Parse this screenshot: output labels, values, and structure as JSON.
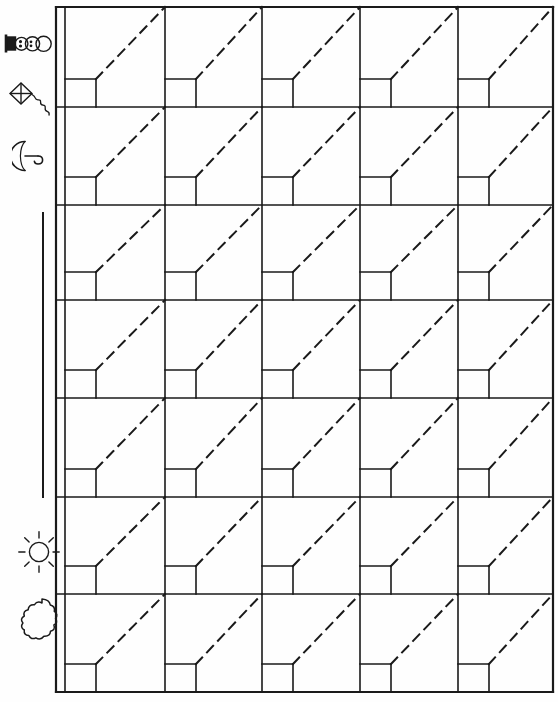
{
  "page": {
    "width": 558,
    "height": 702,
    "background_color": "#fefefe",
    "ink_color": "#1a1a1a"
  },
  "grid": {
    "rows": 7,
    "columns": 5,
    "left_border_x": 56,
    "label_column_right_x": 65,
    "right_border_x": 553,
    "column_boundaries": [
      65,
      165,
      262,
      360,
      458,
      553
    ],
    "row_boundaries": [
      7,
      107,
      205,
      300,
      398,
      497,
      594,
      692
    ],
    "cell_box": {
      "width": 31,
      "height": 28,
      "position": "bottom-left"
    },
    "diagonal": {
      "style": "dashed",
      "from": "box-top-right-corner",
      "to": "cell-top-right-corner",
      "dash_pattern": "9 7",
      "stroke_width": 2
    },
    "stroke_width_outer": 2.2,
    "stroke_width_inner": 1.6
  },
  "bracket": {
    "name": "left-vertical-bracket",
    "x": 43,
    "y_start": 212,
    "y_end": 498,
    "stroke_width": 2
  },
  "icons": [
    {
      "id": "snowman-icon",
      "label": "Snowman",
      "x": 4,
      "y": 28,
      "width": 46,
      "height": 30,
      "rotation": "horizontal"
    },
    {
      "id": "kite-icon",
      "label": "Kite",
      "x": 6,
      "y": 78,
      "width": 46,
      "height": 42
    },
    {
      "id": "umbrella-icon",
      "label": "Umbrella",
      "x": 12,
      "y": 138,
      "width": 34,
      "height": 34
    },
    {
      "id": "sun-icon",
      "label": "Sun",
      "x": 18,
      "y": 530,
      "width": 40,
      "height": 42
    },
    {
      "id": "cloud-icon",
      "label": "Cloud",
      "x": 20,
      "y": 596,
      "width": 40,
      "height": 46
    }
  ],
  "chart_data": {
    "type": "table",
    "rows": 7,
    "columns": 5,
    "cells_filled": 0,
    "row_labels": [
      "Snowman",
      "Kite",
      "Umbrella",
      "",
      "",
      "Sun",
      "Cloud"
    ],
    "column_labels": [
      "",
      "",
      "",
      "",
      ""
    ],
    "note": "Blank worksheet grid: each of the 35 cells contains a dashed diagonal guide line and an empty small square at its lower-left corner."
  }
}
